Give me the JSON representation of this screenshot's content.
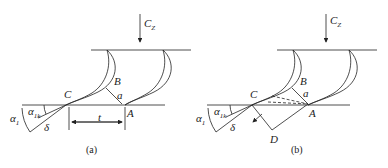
{
  "figure": {
    "panel_a": {
      "caption": "(a)",
      "labels": {
        "flow": "C",
        "flow_sub": "Z",
        "point_c": "C",
        "point_b": "B",
        "point_a": "A",
        "throat": "a",
        "pitch": "t",
        "alpha1": "α",
        "alpha1_sub": "1",
        "alpha1k": "α",
        "alpha1k_sub": "1k",
        "delta": "δ"
      }
    },
    "panel_b": {
      "caption": "(b)",
      "labels": {
        "flow": "C",
        "flow_sub": "Z",
        "point_c": "C",
        "point_b": "B",
        "point_a": "A",
        "point_d": "D",
        "throat": "a",
        "alpha1": "α",
        "alpha1_sub": "1",
        "alpha1k": "α",
        "alpha1k_sub": "1k",
        "delta": "δ"
      }
    },
    "colors": {
      "line": "#222222",
      "background": "#ffffff"
    }
  }
}
